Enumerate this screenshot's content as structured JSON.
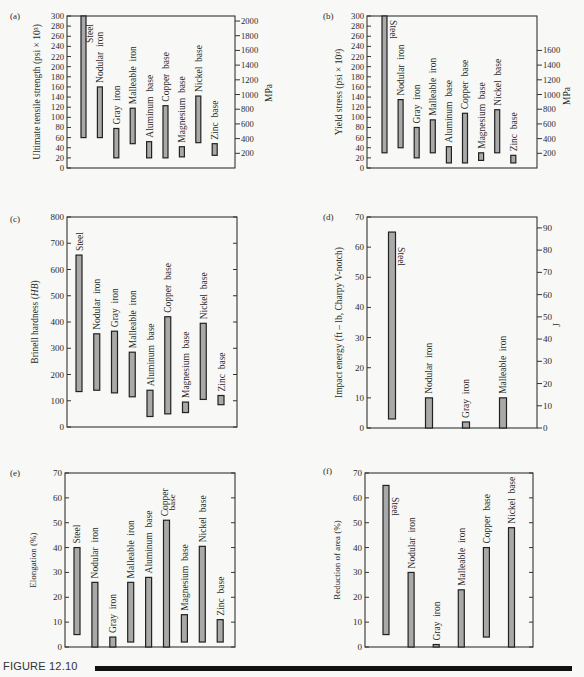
{
  "figure": {
    "caption": "FIGURE 12.10",
    "colors": {
      "bar_fill": "#a9a9a9",
      "bar_stroke": "#222222",
      "axis": "#333333",
      "background": "#f8f8f6"
    }
  },
  "chart_data": [
    {
      "panel": "(a)",
      "type": "bar",
      "subtype": "floating-range",
      "title": "",
      "xlabel": "",
      "ylabel": "Ultimate tensile strength (psi × 10³)",
      "y2label": "MPa",
      "ylim": [
        0,
        300
      ],
      "yticks": [
        0,
        20,
        40,
        60,
        80,
        100,
        120,
        140,
        160,
        180,
        200,
        220,
        240,
        260,
        280,
        300
      ],
      "y2ticks": [
        200,
        400,
        600,
        800,
        1000,
        1200,
        1400,
        1600,
        1800,
        2000
      ],
      "grid": false,
      "categories": [
        "Steel",
        "Nodular iron",
        "Gray iron",
        "Malleable iron",
        "Aluminum base",
        "Copper base",
        "Magnesium base",
        "Nickel base",
        "Zinc base"
      ],
      "series": [
        {
          "name": "low",
          "values": [
            60,
            60,
            20,
            48,
            20,
            20,
            22,
            50,
            25
          ]
        },
        {
          "name": "high",
          "values": [
            300,
            160,
            78,
            118,
            52,
            123,
            42,
            142,
            48
          ]
        }
      ]
    },
    {
      "panel": "(b)",
      "type": "bar",
      "subtype": "floating-range",
      "title": "",
      "xlabel": "",
      "ylabel": "Yield stress (psi × 10³)",
      "y2label": "MPa",
      "ylim": [
        0,
        300
      ],
      "yticks": [
        0,
        20,
        40,
        60,
        80,
        100,
        120,
        140,
        160,
        180,
        200,
        220,
        240,
        260,
        280,
        300
      ],
      "y2ticks": [
        200,
        400,
        600,
        800,
        1000,
        1200,
        1400,
        1600
      ],
      "grid": false,
      "categories": [
        "Steel",
        "Nodular iron",
        "Gray iron",
        "Malleable iron",
        "Aluminum base",
        "Copper base",
        "Magnesium base",
        "Nickel base",
        "Zinc base"
      ],
      "series": [
        {
          "name": "low",
          "values": [
            30,
            40,
            20,
            30,
            10,
            10,
            15,
            30,
            10
          ]
        },
        {
          "name": "high",
          "values": [
            300,
            135,
            80,
            95,
            42,
            108,
            30,
            115,
            25
          ]
        }
      ]
    },
    {
      "panel": "(c)",
      "type": "bar",
      "subtype": "floating-range",
      "title": "",
      "xlabel": "",
      "ylabel": "Brinell hardness (",
      "ylabel_italic": "HB",
      "ylabel_suffix": ")",
      "y2label": "",
      "ylim": [
        0,
        800
      ],
      "yticks": [
        0,
        100,
        200,
        300,
        400,
        500,
        600,
        700,
        800
      ],
      "y2ticks": [],
      "grid": false,
      "categories": [
        "Steel",
        "Nodular iron",
        "Gray iron",
        "Malleable iron",
        "Aluminum base",
        "Copper base",
        "Magnesium base",
        "Nickel base",
        "Zinc base"
      ],
      "series": [
        {
          "name": "low",
          "values": [
            135,
            140,
            130,
            115,
            40,
            50,
            55,
            105,
            85
          ]
        },
        {
          "name": "high",
          "values": [
            655,
            355,
            365,
            285,
            140,
            420,
            95,
            395,
            120
          ]
        }
      ]
    },
    {
      "panel": "(d)",
      "type": "bar",
      "subtype": "floating-range",
      "title": "",
      "xlabel": "",
      "ylabel": "Impact energy (ft – lb, Charpy V-notch)",
      "y2label": "J",
      "ylim": [
        0,
        70
      ],
      "yticks": [
        0,
        10,
        20,
        30,
        40,
        50,
        60,
        70
      ],
      "y2ticks": [
        0,
        10,
        20,
        30,
        40,
        50,
        60,
        70,
        80,
        90
      ],
      "grid": false,
      "categories": [
        "Steel",
        "Nodular iron",
        "Gray iron",
        "Malleable iron"
      ],
      "series": [
        {
          "name": "low",
          "values": [
            3,
            0,
            0,
            0
          ]
        },
        {
          "name": "high",
          "values": [
            65,
            10,
            2,
            10
          ]
        }
      ]
    },
    {
      "panel": "(e)",
      "type": "bar",
      "subtype": "floating-range",
      "title": "",
      "xlabel": "",
      "ylabel": "Elongation (%)",
      "y2label": "",
      "ylim": [
        0,
        70
      ],
      "yticks": [
        0,
        10,
        20,
        30,
        40,
        50,
        60,
        70
      ],
      "y2ticks": [],
      "grid": false,
      "categories": [
        "Steel",
        "Nodular iron",
        "Gray iron",
        "Malleable iron",
        "Aluminum base",
        "Copper base",
        "Magnesium base",
        "Nickel base",
        "Zinc base"
      ],
      "series": [
        {
          "name": "low",
          "values": [
            5,
            0,
            0,
            2,
            0,
            0,
            2,
            2,
            2
          ]
        },
        {
          "name": "high",
          "values": [
            40,
            26,
            4,
            26,
            28,
            51,
            13,
            40.5,
            11
          ]
        }
      ]
    },
    {
      "panel": "(f)",
      "type": "bar",
      "subtype": "floating-range",
      "title": "",
      "xlabel": "",
      "ylabel": "Reduction of area (%)",
      "y2label": "",
      "ylim": [
        0,
        70
      ],
      "yticks": [
        0,
        10,
        20,
        30,
        40,
        50,
        60,
        70
      ],
      "y2ticks": [],
      "grid": false,
      "categories": [
        "Steel",
        "Nodular iron",
        "Gray iron",
        "Malleable iron",
        "Copper base",
        "Nickel base"
      ],
      "series": [
        {
          "name": "low",
          "values": [
            5,
            0,
            0,
            0,
            4,
            0
          ]
        },
        {
          "name": "high",
          "values": [
            65,
            30,
            1,
            23,
            40,
            48
          ]
        }
      ]
    }
  ]
}
